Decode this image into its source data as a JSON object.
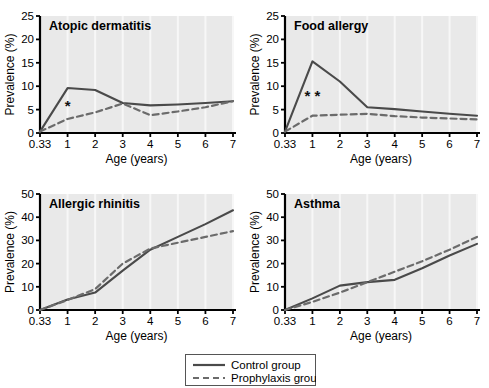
{
  "figure": {
    "legend": {
      "entries": [
        {
          "label": "Control group",
          "style": "solid"
        },
        {
          "label": "Prophylaxis group",
          "style": "dashed"
        }
      ]
    },
    "colors": {
      "plot_background": "#e9e9e9",
      "control_line": "#4a4a4a",
      "prophylaxis_line": "#6b6b6b",
      "axis": "#000000",
      "gridline": "#f7f7f7"
    }
  },
  "chart_data": [
    {
      "type": "line",
      "title": "Atopic dermatitis",
      "xlabel": "Age (years)",
      "ylabel": "Prevalence (%)",
      "xticklabels": [
        "0.33",
        "1",
        "2",
        "3",
        "4",
        "5",
        "6",
        "7"
      ],
      "x": [
        0.33,
        1,
        2,
        3,
        4,
        5,
        6,
        7
      ],
      "ylim": [
        0,
        25
      ],
      "yticks": [
        0,
        5,
        10,
        15,
        20,
        25
      ],
      "grid": true,
      "legend_position": "figure-bottom-center",
      "annotations": [
        {
          "text": "*",
          "x": 1,
          "y": 4.6
        }
      ],
      "series": [
        {
          "name": "Control group",
          "style": "solid",
          "values": [
            0.3,
            9.6,
            9.2,
            6.4,
            5.9,
            6.1,
            6.4,
            6.8
          ]
        },
        {
          "name": "Prophylaxis group",
          "style": "dashed",
          "values": [
            0.3,
            3.0,
            4.4,
            6.3,
            3.8,
            4.6,
            5.5,
            6.8
          ]
        }
      ]
    },
    {
      "type": "line",
      "title": "Food allergy",
      "xlabel": "Age (years)",
      "ylabel": "Prevalence (%)",
      "xticklabels": [
        "0.33",
        "1",
        "2",
        "3",
        "4",
        "5",
        "6",
        "7"
      ],
      "x": [
        0.33,
        1,
        2,
        3,
        4,
        5,
        6,
        7
      ],
      "ylim": [
        0,
        25
      ],
      "yticks": [
        0,
        5,
        10,
        15,
        20,
        25
      ],
      "grid": true,
      "legend_position": "figure-bottom-center",
      "annotations": [
        {
          "text": "*",
          "x": 0.88,
          "y": 6.9
        },
        {
          "text": "*",
          "x": 1.18,
          "y": 6.9
        }
      ],
      "series": [
        {
          "name": "Control group",
          "style": "solid",
          "values": [
            0.3,
            15.3,
            11.0,
            5.5,
            5.1,
            4.6,
            4.1,
            3.7
          ]
        },
        {
          "name": "Prophylaxis group",
          "style": "dashed",
          "values": [
            0.3,
            3.7,
            3.9,
            4.1,
            3.6,
            3.3,
            3.1,
            2.9
          ]
        }
      ]
    },
    {
      "type": "line",
      "title": "Allergic rhinitis",
      "xlabel": "Age (years)",
      "ylabel": "Prevalence (%)",
      "xticklabels": [
        "0.33",
        "1",
        "2",
        "3",
        "4",
        "5",
        "6",
        "7"
      ],
      "x": [
        0.33,
        1,
        2,
        3,
        4,
        5,
        6,
        7
      ],
      "ylim": [
        0,
        50
      ],
      "yticks": [
        0,
        10,
        20,
        30,
        40,
        50
      ],
      "grid": true,
      "legend_position": "figure-bottom-center",
      "annotations": [],
      "series": [
        {
          "name": "Control group",
          "style": "solid",
          "values": [
            0.0,
            4.5,
            7.5,
            17.0,
            26.0,
            31.5,
            37.0,
            43.0
          ]
        },
        {
          "name": "Prophylaxis group",
          "style": "dashed",
          "values": [
            0.0,
            4.3,
            9.0,
            20.0,
            26.5,
            29.0,
            31.5,
            34.0
          ]
        }
      ]
    },
    {
      "type": "line",
      "title": "Asthma",
      "xlabel": "Age (years)",
      "ylabel": "Prevalence (%)",
      "xticklabels": [
        "0.33",
        "1",
        "2",
        "3",
        "4",
        "5",
        "6",
        "7"
      ],
      "x": [
        0.33,
        1,
        2,
        3,
        4,
        5,
        6,
        7
      ],
      "ylim": [
        0,
        50
      ],
      "yticks": [
        0,
        10,
        20,
        30,
        40,
        50
      ],
      "grid": true,
      "legend_position": "figure-bottom-center",
      "annotations": [],
      "series": [
        {
          "name": "Control group",
          "style": "solid",
          "values": [
            0.0,
            5.0,
            10.5,
            12.0,
            13.0,
            18.0,
            23.5,
            28.5
          ]
        },
        {
          "name": "Prophylaxis group",
          "style": "dashed",
          "values": [
            0.0,
            3.5,
            7.5,
            12.0,
            16.5,
            21.0,
            26.0,
            31.5
          ]
        }
      ]
    }
  ]
}
